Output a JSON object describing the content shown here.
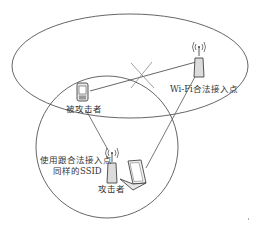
{
  "diagram": {
    "colors": {
      "stroke": "#444444",
      "text": "#333333",
      "background": "#ffffff"
    },
    "nodes": {
      "victim": {
        "label": "被攻击者",
        "icon": "phone-icon"
      },
      "legit_ap": {
        "label": "Wi-Fi合法接入点",
        "icon": "wifi-access-point-icon"
      },
      "attacker": {
        "label": "攻击者",
        "icon": "laptop-icon"
      },
      "rogue_ap": {
        "label_line1": "使用跟合法接入点",
        "label_line2": "同样的SSID",
        "icon": "wifi-access-point-icon"
      }
    },
    "edges": [
      {
        "from": "victim",
        "to": "legit_ap",
        "state": "blocked",
        "marker": "x-mark"
      },
      {
        "from": "victim",
        "to": "rogue_ap",
        "state": "connected"
      },
      {
        "from": "attacker",
        "to": "legit_ap",
        "state": "connected"
      }
    ],
    "regions": [
      {
        "name": "legit-ap-coverage",
        "shape": "ellipse"
      },
      {
        "name": "rogue-ap-coverage",
        "shape": "circle"
      }
    ]
  }
}
